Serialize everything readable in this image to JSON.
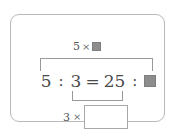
{
  "card": {
    "border_color": "#b9b9b9"
  },
  "diagram": {
    "type": "proportion-equation",
    "top_annotation": {
      "multiplier": "5",
      "times_symbol": "×",
      "operand_placeholder": "filled-square",
      "operand_color": "#8d8d8d"
    },
    "equation": {
      "left_term": "5",
      "colon_1": ":",
      "left_term_2": "3",
      "equals": "=",
      "right_term": "25",
      "colon_2": ":",
      "unknown_placeholder": "filled-square",
      "unknown_color": "#8d8d8d",
      "text_color": "#4a4a4a"
    },
    "bottom_annotation": {
      "multiplier": "3",
      "times_symbol": "×",
      "answer_box_value": "",
      "answer_box_border": "#a8a8a8"
    },
    "brackets": {
      "top_color": "#9a9a9a",
      "bottom_color": "#9a9a9a"
    }
  }
}
